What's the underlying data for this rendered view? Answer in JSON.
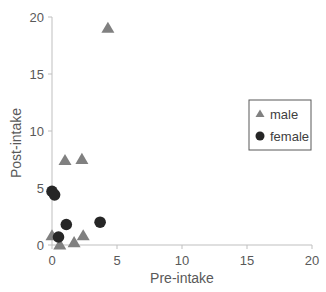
{
  "chart_data": {
    "type": "scatter",
    "title": "",
    "xlabel": "Pre-intake",
    "ylabel": "Post-intake",
    "xlim": [
      0,
      20
    ],
    "ylim": [
      0,
      20
    ],
    "xticks": [
      0,
      5,
      10,
      15,
      20
    ],
    "yticks": [
      0,
      5,
      10,
      15,
      20
    ],
    "grid": false,
    "legend_position": "right",
    "series": [
      {
        "name": "male",
        "marker": "triangle",
        "color": "#808080",
        "points": [
          {
            "x": 4.3,
            "y": 19.0
          },
          {
            "x": 1.0,
            "y": 7.4
          },
          {
            "x": 2.3,
            "y": 7.5
          },
          {
            "x": 0.0,
            "y": 0.8
          },
          {
            "x": 0.6,
            "y": 0.0
          },
          {
            "x": 1.7,
            "y": 0.2
          },
          {
            "x": 2.4,
            "y": 0.8
          }
        ]
      },
      {
        "name": "female",
        "marker": "circle",
        "color": "#262626",
        "points": [
          {
            "x": 0.0,
            "y": 4.7
          },
          {
            "x": 0.2,
            "y": 4.4
          },
          {
            "x": 1.1,
            "y": 1.8
          },
          {
            "x": 3.7,
            "y": 2.0
          },
          {
            "x": 0.5,
            "y": 0.7
          }
        ]
      }
    ]
  }
}
